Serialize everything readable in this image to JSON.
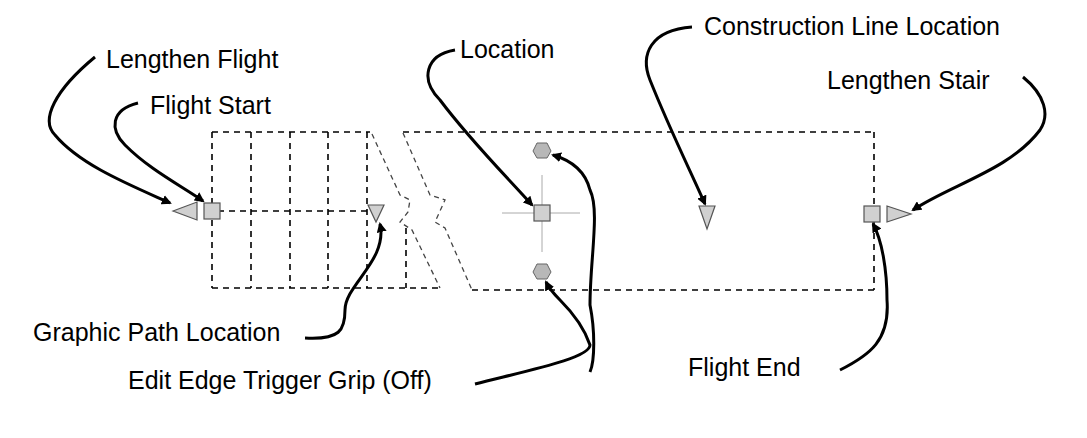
{
  "diagram": {
    "colors": {
      "grip_fill": "#d0d0d0",
      "grip_stroke": "#555555",
      "grip_circle_fill": "#b0b0b0",
      "outline": "#000000",
      "construction": "#999999",
      "leader": "#000000"
    }
  },
  "labels": {
    "lengthen_flight": "Lengthen Flight",
    "flight_start": "Flight Start",
    "location": "Location",
    "construction_line_location": "Construction Line Location",
    "lengthen_stair": "Lengthen Stair",
    "graphic_path_location": "Graphic Path Location",
    "edit_edge_trigger_grip": "Edit Edge Trigger Grip (Off)",
    "flight_end": "Flight End"
  }
}
